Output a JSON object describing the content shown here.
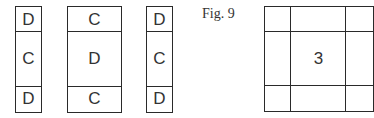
{
  "figure": {
    "caption": "Fig. 9",
    "strips": [
      {
        "cells": [
          "D",
          "C",
          "D"
        ]
      },
      {
        "cells": [
          "C",
          "D",
          "C"
        ]
      },
      {
        "cells": [
          "D",
          "C",
          "D"
        ]
      }
    ],
    "grid": {
      "rows": 3,
      "center_label": "3"
    }
  }
}
